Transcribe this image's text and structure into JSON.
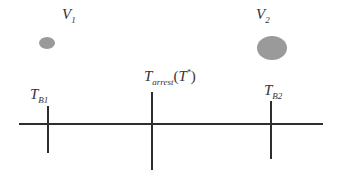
{
  "diagram": {
    "colors": {
      "line": "#2e2e2e",
      "circle_fill": "#9a9a9a",
      "text": "#333333"
    },
    "timeline": {
      "x1": 19,
      "x2": 323,
      "y": 124
    },
    "ticks": [
      {
        "id": "T_B1",
        "x": 48,
        "y1": 106,
        "y2": 153
      },
      {
        "id": "T_arrest",
        "x": 152,
        "y1": 92,
        "y2": 170
      },
      {
        "id": "T_B2",
        "x": 271,
        "y1": 101,
        "y2": 159
      }
    ],
    "circles": [
      {
        "id": "V1",
        "cx": 47,
        "cy": 43,
        "rx": 8,
        "ry": 6
      },
      {
        "id": "V2",
        "cx": 272,
        "cy": 48,
        "rx": 15,
        "ry": 12
      }
    ],
    "labels": {
      "v1": {
        "main": "V",
        "sub": "1"
      },
      "v2": {
        "main": "V",
        "sub": "2"
      },
      "tb1": {
        "main": "T",
        "sub": "B1"
      },
      "tarrest": {
        "main": "T",
        "sub": "arrest",
        "paren_open": "(",
        "paren_main": "T",
        "sup": "*",
        "paren_close": ")"
      },
      "tb2": {
        "main": "T",
        "sub": "B2"
      }
    }
  }
}
